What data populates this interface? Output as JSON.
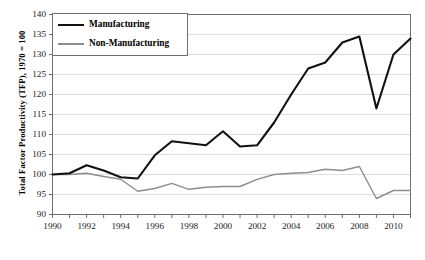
{
  "chart_data": {
    "type": "line",
    "title": "",
    "xlabel": "",
    "ylabel": "Total Factor Productivity (TFP), 1970 = 100",
    "xlim": [
      1990,
      2011
    ],
    "ylim": [
      90,
      140
    ],
    "yticks": [
      90,
      95,
      100,
      105,
      110,
      115,
      120,
      125,
      130,
      135,
      140
    ],
    "xticks": [
      1990,
      1992,
      1994,
      1996,
      1998,
      2000,
      2002,
      2004,
      2006,
      2008,
      2010
    ],
    "xtick_labels": [
      "1990",
      "1992",
      "1994",
      "1996",
      "1998",
      "2000",
      "2002",
      "2004",
      "2006",
      "2008",
      "2010"
    ],
    "ytick_labels": [
      "90",
      "95",
      "100",
      "105",
      "110",
      "115",
      "120",
      "125",
      "130",
      "135",
      "140"
    ],
    "grid": "horizontal",
    "legend_position": "upper-left",
    "x": [
      1990,
      1991,
      1992,
      1993,
      1994,
      1995,
      1996,
      1997,
      1998,
      1999,
      2000,
      2001,
      2002,
      2003,
      2004,
      2005,
      2006,
      2007,
      2008,
      2009,
      2010,
      2011
    ],
    "series": [
      {
        "name": "Manufacturing",
        "color": "#111111",
        "line_width": 2.1,
        "values": [
          100.0,
          100.3,
          102.3,
          101.0,
          99.3,
          99.0,
          104.8,
          108.3,
          107.8,
          107.3,
          110.8,
          107.0,
          107.3,
          113.0,
          120.0,
          126.5,
          128.0,
          133.0,
          134.5,
          116.5,
          130.0,
          134.0
        ]
      },
      {
        "name": "Non-Manufacturing",
        "color": "#8d8d8d",
        "line_width": 1.4,
        "values": [
          100.0,
          100.0,
          100.3,
          99.5,
          98.8,
          95.8,
          96.5,
          97.8,
          96.3,
          96.8,
          97.0,
          97.0,
          98.8,
          100.0,
          100.3,
          100.5,
          101.3,
          101.0,
          102.0,
          94.0,
          96.0,
          96.0
        ]
      }
    ]
  },
  "legend": {
    "items": [
      {
        "label": "Manufacturing"
      },
      {
        "label": "Non-Manufacturing"
      }
    ]
  },
  "axis": {
    "y_title": "Total Factor Productivity (TFP), 1970 = 100"
  },
  "colors": {
    "manufacturing": "#111111",
    "non_manufacturing": "#8d8d8d",
    "grid": "#d9d9d9",
    "axis": "#6e6e6e",
    "text": "#1a1a1a"
  }
}
